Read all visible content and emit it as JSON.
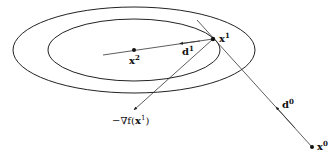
{
  "diagram": {
    "type": "conjugate-gradient-contours",
    "colors": {
      "stroke": "#222222",
      "background": "#ffffff"
    },
    "ellipses": [
      {
        "name": "outer-contour",
        "cx": 134,
        "cy": 50,
        "rx": 121,
        "ry": 43
      },
      {
        "name": "inner-contour",
        "cx": 134,
        "cy": 50,
        "rx": 86,
        "ry": 31
      }
    ],
    "points": {
      "x0": {
        "x": 312,
        "y": 147,
        "label": "x",
        "sup": "0"
      },
      "x1": {
        "x": 213,
        "y": 39,
        "label": "x",
        "sup": "1"
      },
      "x2": {
        "x": 134,
        "y": 50,
        "label": "x",
        "sup": "2"
      }
    },
    "labels": {
      "d0": {
        "main": "d",
        "sup": "0"
      },
      "d1": {
        "main": "d",
        "sup": "1"
      },
      "neg_grad": {
        "prefix": "−∇f(",
        "main": "x",
        "sup": "1",
        "suffix": ")"
      }
    }
  }
}
